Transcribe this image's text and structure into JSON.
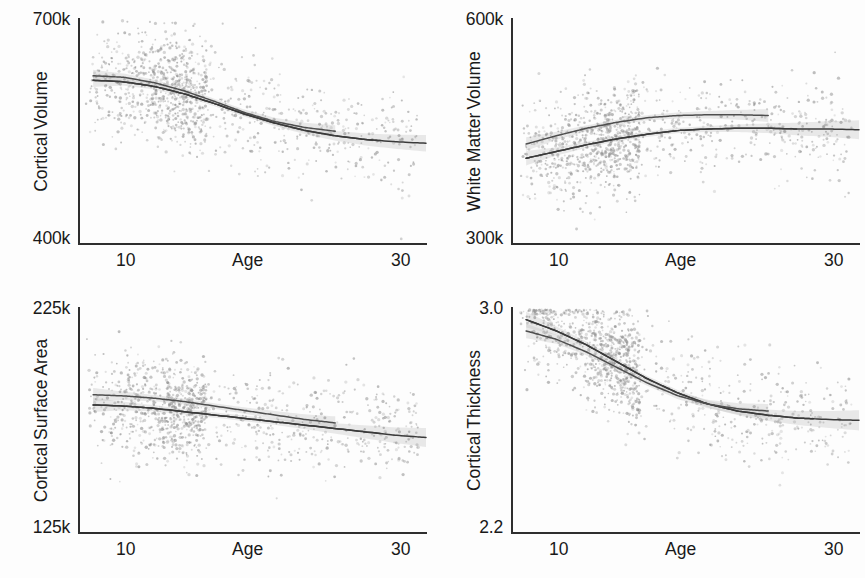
{
  "figure": {
    "background": "#fdfdfd",
    "point_color": "#8d8d8d",
    "trend_color": "#3a3a3a",
    "band_color": "#b9b9b9"
  },
  "panels": [
    {
      "id": "cortical-volume",
      "ylabel_line1": "Cortical",
      "ylabel_line2": "Volume",
      "ytick_high": "700k",
      "ytick_low": "400k",
      "xlabel": "Age",
      "xtick_low": "10",
      "xtick_high": "30"
    },
    {
      "id": "white-matter-volume",
      "ylabel_line1": "White Matter",
      "ylabel_line2": "Volume",
      "ytick_high": "600k",
      "ytick_low": "300k",
      "xlabel": "Age",
      "xtick_low": "10",
      "xtick_high": "30"
    },
    {
      "id": "cortical-surface-area",
      "ylabel_line1": "Cortical",
      "ylabel_line2": "Surface Area",
      "ytick_high": "225k",
      "ytick_low": "125k",
      "xlabel": "Age",
      "xtick_low": "10",
      "xtick_high": "30"
    },
    {
      "id": "cortical-thickness",
      "ylabel_line1": "Cortical",
      "ylabel_line2": "Thickness",
      "ytick_high": "3.0",
      "ytick_low": "2.2",
      "xlabel": "Age",
      "xtick_low": "10",
      "xtick_high": "30"
    }
  ],
  "chart_data": [
    {
      "type": "scatter",
      "title": "Cortical Volume",
      "xlabel": "Age",
      "ylabel": "Cortical Volume",
      "xlim": [
        7,
        30
      ],
      "ylim": [
        400000,
        700000
      ],
      "xticks": [
        10,
        30
      ],
      "xtick_labels": [
        "10",
        "30"
      ],
      "yticks": [
        400000,
        700000
      ],
      "ytick_labels": [
        "400k",
        "700k"
      ],
      "grid": false,
      "legend": "none",
      "n_points_approx": 1100,
      "point_x_range": [
        7.5,
        29.5
      ],
      "point_density_peak_x": 12,
      "series": [
        {
          "name": "group-1",
          "kind": "trend-line",
          "x": [
            8,
            10,
            12,
            14,
            16,
            18,
            20,
            22,
            24,
            26,
            28,
            30
          ],
          "y": [
            617000,
            615000,
            609000,
            599000,
            586000,
            572000,
            560000,
            550000,
            543000,
            538000,
            535000,
            533000
          ],
          "ci_half_width": [
            9000,
            5000,
            4000,
            3500,
            3500,
            3500,
            4000,
            5000,
            6500,
            8000,
            9500,
            11000
          ],
          "x_solid_end": 27
        },
        {
          "name": "group-2",
          "kind": "trend-line",
          "x": [
            8,
            10,
            12,
            14,
            16,
            18,
            20,
            22,
            24
          ],
          "y": [
            623000,
            621000,
            614000,
            603000,
            589000,
            574000,
            562000,
            554000,
            549000
          ],
          "ci_half_width": [
            8000,
            5000,
            4000,
            3500,
            3500,
            4000,
            5000,
            6500,
            8000
          ],
          "x_solid_end": 24
        }
      ]
    },
    {
      "type": "scatter",
      "title": "White Matter Volume",
      "xlabel": "Age",
      "ylabel": "White Matter Volume",
      "xlim": [
        7,
        30
      ],
      "ylim": [
        300000,
        600000
      ],
      "xticks": [
        10,
        30
      ],
      "xtick_labels": [
        "10",
        "30"
      ],
      "yticks": [
        300000,
        600000
      ],
      "ytick_labels": [
        "300k",
        "600k"
      ],
      "grid": false,
      "legend": "none",
      "n_points_approx": 1100,
      "point_x_range": [
        7.5,
        29.5
      ],
      "point_density_peak_x": 12,
      "series": [
        {
          "name": "group-1",
          "kind": "trend-line",
          "x": [
            8,
            10,
            12,
            14,
            16,
            18,
            20,
            22,
            24,
            26,
            28,
            30
          ],
          "y": [
            413000,
            422000,
            431000,
            439000,
            445000,
            450000,
            452000,
            453000,
            453000,
            452000,
            452000,
            451000
          ],
          "ci_half_width": [
            9500,
            5500,
            4000,
            3500,
            3500,
            3500,
            4000,
            5000,
            6500,
            8500,
            10500,
            12500
          ],
          "x_solid_end": 26
        },
        {
          "name": "group-2",
          "kind": "trend-line",
          "x": [
            8,
            10,
            12,
            14,
            16,
            18,
            20,
            22,
            24
          ],
          "y": [
            432000,
            443000,
            453000,
            461000,
            467000,
            470000,
            471000,
            471000,
            470000
          ],
          "ci_half_width": [
            9000,
            5500,
            4000,
            3500,
            3500,
            4000,
            5000,
            6500,
            8500
          ],
          "x_solid_end": 24
        }
      ]
    },
    {
      "type": "scatter",
      "title": "Cortical Surface Area",
      "xlabel": "Age",
      "ylabel": "Cortical Surface Area",
      "xlim": [
        7,
        30
      ],
      "ylim": [
        125000,
        225000
      ],
      "xticks": [
        10,
        30
      ],
      "xtick_labels": [
        "10",
        "30"
      ],
      "yticks": [
        125000,
        225000
      ],
      "ytick_labels": [
        "125k",
        "225k"
      ],
      "grid": false,
      "legend": "none",
      "n_points_approx": 1100,
      "point_x_range": [
        7.5,
        29.5
      ],
      "point_density_peak_x": 12,
      "series": [
        {
          "name": "group-1",
          "kind": "trend-line",
          "x": [
            8,
            10,
            12,
            14,
            16,
            18,
            20,
            22,
            24,
            26,
            28,
            30
          ],
          "y": [
            181500,
            181000,
            180000,
            178500,
            177000,
            175500,
            174000,
            172500,
            171000,
            169500,
            168000,
            167000
          ],
          "ci_half_width": [
            3200,
            1900,
            1400,
            1200,
            1200,
            1200,
            1400,
            1800,
            2300,
            2900,
            3500,
            4200
          ],
          "x_solid_end": 27
        },
        {
          "name": "group-2",
          "kind": "trend-line",
          "x": [
            8,
            10,
            12,
            14,
            16,
            18,
            20,
            22,
            24
          ],
          "y": [
            186000,
            185500,
            184500,
            183000,
            181000,
            179000,
            177000,
            175000,
            173500
          ],
          "ci_half_width": [
            3000,
            1900,
            1400,
            1200,
            1200,
            1400,
            1800,
            2300,
            2900
          ],
          "x_solid_end": 24
        }
      ]
    },
    {
      "type": "scatter",
      "title": "Cortical Thickness",
      "xlabel": "Age",
      "ylabel": "Cortical Thickness",
      "xlim": [
        7,
        30
      ],
      "ylim": [
        2.2,
        3.0
      ],
      "xticks": [
        10,
        30
      ],
      "xtick_labels": [
        "10",
        "30"
      ],
      "yticks": [
        2.2,
        3.0
      ],
      "ytick_labels": [
        "2.2",
        "3.0"
      ],
      "grid": false,
      "legend": "none",
      "n_points_approx": 1100,
      "point_x_range": [
        7.5,
        29.5
      ],
      "point_density_peak_x": 12,
      "series": [
        {
          "name": "group-1",
          "kind": "trend-line",
          "x": [
            8,
            10,
            12,
            14,
            16,
            18,
            20,
            22,
            24,
            26,
            28,
            30
          ],
          "y": [
            2.955,
            2.915,
            2.865,
            2.805,
            2.745,
            2.695,
            2.655,
            2.63,
            2.615,
            2.605,
            2.6,
            2.597
          ],
          "ci_half_width": [
            0.028,
            0.016,
            0.012,
            0.01,
            0.01,
            0.01,
            0.012,
            0.015,
            0.02,
            0.025,
            0.03,
            0.036
          ],
          "x_solid_end": 27
        },
        {
          "name": "group-2",
          "kind": "trend-line",
          "x": [
            8,
            10,
            12,
            14,
            16,
            18,
            20,
            22,
            24
          ],
          "y": [
            2.915,
            2.885,
            2.84,
            2.785,
            2.73,
            2.685,
            2.655,
            2.638,
            2.63
          ],
          "ci_half_width": [
            0.026,
            0.016,
            0.012,
            0.01,
            0.01,
            0.012,
            0.015,
            0.02,
            0.025
          ],
          "x_solid_end": 24
        }
      ]
    }
  ]
}
